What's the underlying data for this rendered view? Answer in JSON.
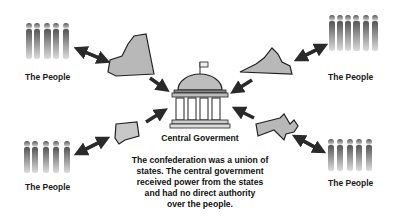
{
  "diagram": {
    "center": {
      "label": "Central Goverment",
      "icon": "capitol-building-icon"
    },
    "caption_lines": [
      "The confederation was a union of",
      "states. The central government",
      "received power from the states",
      "and had no direct authority",
      "over the people."
    ],
    "groups": [
      {
        "position": "top-left",
        "label": "The People",
        "state": "New York"
      },
      {
        "position": "top-right",
        "label": "The People",
        "state": "Virginia"
      },
      {
        "position": "bottom-left",
        "label": "The People",
        "state": "Connecticut"
      },
      {
        "position": "bottom-right",
        "label": "The People",
        "state": "Massachusetts"
      }
    ],
    "colors": {
      "state_fill": "#b8b8b8",
      "arrow": "#2a2a2a",
      "people": "#6e6e6e",
      "text": "#111111"
    }
  }
}
